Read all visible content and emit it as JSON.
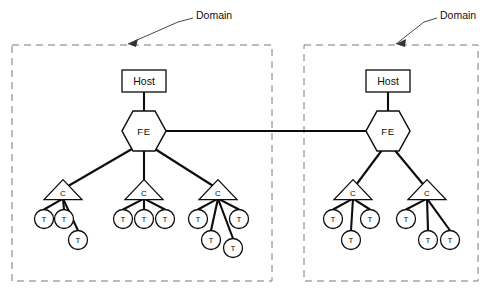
{
  "canvas": {
    "width": 492,
    "height": 298,
    "background": "#ffffff"
  },
  "style": {
    "line_color": "#0d0d0d",
    "domain_border_color": "#7a7a7a",
    "node_fill": "#ffffff",
    "annotation_color": "#333333"
  },
  "annotations": [
    {
      "id": "domain-label-left",
      "text": "Domain",
      "text_x": 196,
      "text_y": 15,
      "leader": "M 193 18 L 178 22 L 128 44",
      "arrow": "M 128 44 L 138 39 L 136 47 Z"
    },
    {
      "id": "domain-label-right",
      "text": "Domain",
      "text_x": 440,
      "text_y": 15,
      "leader": "M 437 18 L 424 22 L 396 44",
      "arrow": "M 396 44 L 406 39 L 405 47 Z"
    }
  ],
  "domains": [
    {
      "id": "domain-left",
      "name": "Domain",
      "box": {
        "x": 12,
        "y": 45,
        "width": 260,
        "height": 236
      },
      "host": {
        "label": "Host",
        "x": 122,
        "y": 70,
        "width": 44,
        "height": 22
      },
      "fe": {
        "label": "FE",
        "cx": 144,
        "cy": 131,
        "rx": 22,
        "ry": 20
      },
      "concentrators": [
        {
          "label": "C",
          "cx": 63,
          "cy": 192,
          "half_width": 19,
          "height": 20,
          "terminals": [
            {
              "label": "T",
              "cx": 44,
              "cy": 219,
              "r": 9.5
            },
            {
              "label": "T",
              "cx": 64,
              "cy": 219,
              "r": 9.5
            },
            {
              "label": "T",
              "cx": 78,
              "cy": 240,
              "r": 9.5
            }
          ]
        },
        {
          "label": "C",
          "cx": 144,
          "cy": 192,
          "half_width": 19,
          "height": 20,
          "terminals": [
            {
              "label": "T",
              "cx": 123,
              "cy": 219,
              "r": 9.5
            },
            {
              "label": "T",
              "cx": 144,
              "cy": 219,
              "r": 9.5
            },
            {
              "label": "T",
              "cx": 165,
              "cy": 219,
              "r": 9.5
            }
          ]
        },
        {
          "label": "C",
          "cx": 218,
          "cy": 192,
          "half_width": 19,
          "height": 20,
          "terminals": [
            {
              "label": "T",
              "cx": 198,
              "cy": 219,
              "r": 9.5
            },
            {
              "label": "T",
              "cx": 239,
              "cy": 219,
              "r": 9.5
            },
            {
              "label": "T",
              "cx": 211,
              "cy": 240,
              "r": 9.5
            },
            {
              "label": "T",
              "cx": 233,
              "cy": 248,
              "r": 9.5
            }
          ]
        }
      ]
    },
    {
      "id": "domain-right",
      "name": "Domain",
      "box": {
        "x": 304,
        "y": 45,
        "width": 174,
        "height": 236
      },
      "host": {
        "label": "Host",
        "x": 366,
        "y": 70,
        "width": 44,
        "height": 22
      },
      "fe": {
        "label": "FE",
        "cx": 388,
        "cy": 131,
        "rx": 22,
        "ry": 20
      },
      "concentrators": [
        {
          "label": "C",
          "cx": 353,
          "cy": 192,
          "half_width": 19,
          "height": 20,
          "terminals": [
            {
              "label": "T",
              "cx": 333,
              "cy": 219,
              "r": 9.5
            },
            {
              "label": "T",
              "cx": 370,
              "cy": 219,
              "r": 9.5
            },
            {
              "label": "T",
              "cx": 351,
              "cy": 240,
              "r": 9.5
            }
          ]
        },
        {
          "label": "C",
          "cx": 427,
          "cy": 192,
          "half_width": 19,
          "height": 20,
          "terminals": [
            {
              "label": "T",
              "cx": 406,
              "cy": 219,
              "r": 9.5
            },
            {
              "label": "T",
              "cx": 428,
              "cy": 240,
              "r": 9.5
            },
            {
              "label": "T",
              "cx": 450,
              "cy": 240,
              "r": 9.5
            }
          ]
        }
      ]
    }
  ],
  "inter_domain_link": {
    "id": "fe-to-fe-trunk",
    "from": "domain-left.fe",
    "to": "domain-right.fe",
    "x1": 166,
    "y1": 131,
    "x2": 366,
    "y2": 131
  }
}
